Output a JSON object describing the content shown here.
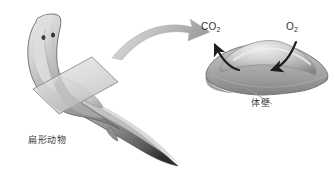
{
  "figure": {
    "background_color": "#ffffff",
    "width": 335,
    "height": 182
  },
  "labels": {
    "organism": "扁形动物",
    "body_wall": "体壁",
    "co2_main": "CO",
    "co2_sub": "2",
    "o2_main": "O",
    "o2_sub": "2"
  },
  "colors": {
    "body_light": "#e8e8e8",
    "body_mid": "#b9b9b9",
    "body_dark": "#8a8a8a",
    "body_outline": "#6e6e6e",
    "plane_fill": "#d9d9d9",
    "plane_outline": "#8f8f8f",
    "arrow_gray": "#a8a8a8",
    "arrow_dark": "#1d1d1d",
    "leader_line": "#9a9a9a",
    "text": "#2b2b2b",
    "eyespot": "#3a3a3a"
  },
  "elements": {
    "flatworm_name": "flatworm-body",
    "cross_section_plane_name": "cross-section-plane",
    "transition_arrow_name": "magnify-arrow",
    "cross_section_name": "cross-section-view",
    "co2_arrow_name": "co2-outflow-arrow",
    "o2_arrow_name": "o2-inflow-arrow",
    "leader_name": "body-wall-leader-line"
  }
}
